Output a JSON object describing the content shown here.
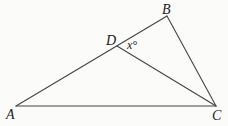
{
  "diagram": {
    "type": "geometry-triangle",
    "points": {
      "A": {
        "label": "A",
        "x": 16,
        "y": 106
      },
      "B": {
        "label": "B",
        "x": 167,
        "y": 16
      },
      "C": {
        "label": "C",
        "x": 216,
        "y": 106
      },
      "D": {
        "label": "D",
        "x": 117,
        "y": 46
      }
    },
    "segments": [
      "AB",
      "BC",
      "AC",
      "DC"
    ],
    "angle_label": {
      "text": "x°",
      "at": "D",
      "between": [
        "DB",
        "DC"
      ]
    },
    "colors": {
      "line": "#444444",
      "text": "#222222",
      "background": "#fbfbf9"
    }
  }
}
